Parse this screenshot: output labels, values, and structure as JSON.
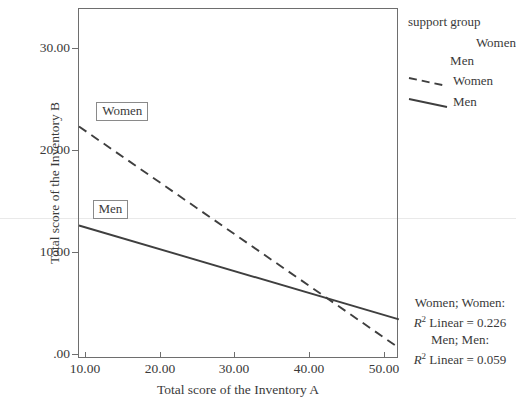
{
  "chart_data": {
    "type": "line",
    "title": "",
    "xlabel": "Total score of the Inventory A",
    "ylabel": "Total score of the Inventory B",
    "xlim": [
      8.2,
      52.2
    ],
    "ylim": [
      0,
      33.5
    ],
    "xticks": [
      "10.00",
      "20.00",
      "30.00",
      "40.00",
      "50.00"
    ],
    "xtick_values": [
      10,
      20,
      30,
      40,
      50
    ],
    "yticks": [
      ".00",
      "10.00",
      "20.00",
      "30.00"
    ],
    "ytick_values": [
      0,
      10,
      20,
      30
    ],
    "grid": false,
    "legend_position": "right-top",
    "series": [
      {
        "name": "Women",
        "style": "dashed",
        "color": "#3f3f3f",
        "x": [
          9.2,
          52.0
        ],
        "y": [
          22.3,
          0.6
        ]
      },
      {
        "name": "Men",
        "style": "solid",
        "color": "#3f3f3f",
        "x": [
          9.2,
          52.0
        ],
        "y": [
          12.6,
          3.4
        ]
      }
    ],
    "point_labels": [
      {
        "text": "Women",
        "x": 11.5,
        "y": 23.8
      },
      {
        "text": "Men",
        "x": 11.0,
        "y": 14.2
      }
    ],
    "annotations": [
      {
        "group": "Women; Women:",
        "stat": "R² Linear = 0.226",
        "r2": 0.226
      },
      {
        "group": "Men; Men:",
        "stat": "R² Linear = 0.059",
        "r2": 0.059
      }
    ]
  },
  "legend": {
    "title": "support group",
    "marker_entries": [
      {
        "label": "Women"
      },
      {
        "label": "Men"
      }
    ],
    "line_entries": [
      {
        "label": "Women",
        "style": "dashed"
      },
      {
        "label": "Men",
        "style": "solid"
      }
    ]
  },
  "rsq": {
    "women_group": "Women; Women:",
    "women_r_prefix": "R",
    "women_r_sup": "2",
    "women_r_text": " Linear = 0.226",
    "men_group": "Men; Men:",
    "men_r_prefix": "R",
    "men_r_sup": "2",
    "men_r_text": " Linear = 0.059"
  },
  "axes": {
    "x_title": "Total score of the Inventory A",
    "y_title": "Total score of the Inventory B",
    "x_tick_labels": [
      "10.00",
      "20.00",
      "30.00",
      "40.00",
      "50.00"
    ],
    "y_tick_labels": [
      "30.00",
      "20.00",
      "10.00",
      ".00"
    ]
  },
  "colors": {
    "line": "#3f3f3f",
    "axis": "#6e6e6e",
    "text": "#3a3a3a",
    "label_border": "#8a8a8a",
    "rule": "#e9e9e9"
  }
}
